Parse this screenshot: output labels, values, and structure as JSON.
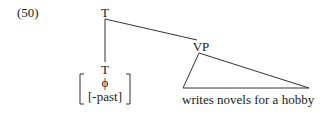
{
  "example_number": "(50)",
  "tree": {
    "root": {
      "label": "T"
    },
    "left_child": {
      "label": "T",
      "features": {
        "line1": "ϕ",
        "line2": "[-past]"
      }
    },
    "right_child": {
      "label": "VP",
      "triangle_content": "writes novels for a hobby"
    }
  },
  "colors": {
    "text": "#1a1a1a",
    "lines": "#333333",
    "background": "#ffffff"
  }
}
